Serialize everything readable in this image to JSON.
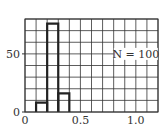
{
  "chart_data": {
    "type": "bar",
    "style": "histogram-outline",
    "title": "",
    "xlabel": "",
    "ylabel": "",
    "bins": [
      [
        0.1,
        0.2
      ],
      [
        0.2,
        0.3
      ],
      [
        0.3,
        0.4
      ]
    ],
    "categories": [
      "0.1-0.2",
      "0.2-0.3",
      "0.3-0.4"
    ],
    "values": [
      8,
      76,
      16
    ],
    "xlim": [
      0,
      1.2
    ],
    "ylim": [
      0,
      80
    ],
    "x_ticks": [
      0,
      0.5,
      1.0
    ],
    "x_tick_labels": [
      "0",
      "0.5",
      "1.0"
    ],
    "y_ticks": [
      0,
      50
    ],
    "y_tick_labels": [
      "0",
      "50"
    ],
    "grid": true,
    "grid_x_step": 0.1,
    "grid_y_step": 10,
    "annotation": "N = 100",
    "annotation_pos": [
      1.0,
      50
    ],
    "legend": null
  },
  "colors": {
    "grid": "#333333",
    "bar_edge": "#222222",
    "background": "#ffffff"
  }
}
